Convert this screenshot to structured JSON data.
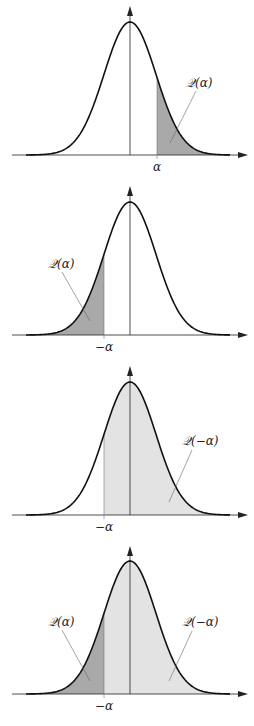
{
  "colors": {
    "curve": "#111111",
    "axis": "#222222",
    "dark_shade": "#a9a9a9",
    "light_shade": "#e3e3e3",
    "leader": "#666666"
  },
  "gaussian": {
    "center_x": 130,
    "sigma_px": 26,
    "height_px": 133,
    "x_min": 12,
    "x_max": 248
  },
  "panels": [
    {
      "id": "panel-1",
      "axis_y": 155,
      "top_y": 6,
      "marker_x": 157,
      "marker_label": "α",
      "regions": [
        {
          "from": 157,
          "to": 248,
          "shade": "dark"
        }
      ],
      "annotations": [
        {
          "text": "𝒬(α)",
          "tx": 186,
          "ty": 87,
          "lx1": 196,
          "ly1": 91,
          "lx2": 170,
          "ly2": 143
        }
      ]
    },
    {
      "id": "panel-2",
      "axis_y": 335,
      "top_y": 186,
      "marker_x": 104,
      "marker_label": "−α",
      "regions": [
        {
          "from": 12,
          "to": 104,
          "shade": "dark"
        }
      ],
      "annotations": [
        {
          "text": "𝒬(α)",
          "tx": 48,
          "ty": 268,
          "lx1": 62,
          "ly1": 272,
          "lx2": 90,
          "ly2": 321
        }
      ]
    },
    {
      "id": "panel-3",
      "axis_y": 515,
      "top_y": 366,
      "marker_x": 104,
      "marker_label": "−α",
      "regions": [
        {
          "from": 104,
          "to": 248,
          "shade": "light"
        }
      ],
      "annotations": [
        {
          "text": "𝒬(−α)",
          "tx": 182,
          "ty": 445,
          "lx1": 192,
          "ly1": 450,
          "lx2": 169,
          "ly2": 502
        }
      ]
    },
    {
      "id": "panel-4",
      "axis_y": 694,
      "top_y": 546,
      "marker_x": 104,
      "marker_label": "−α",
      "regions": [
        {
          "from": 104,
          "to": 248,
          "shade": "light"
        },
        {
          "from": 12,
          "to": 104,
          "shade": "dark"
        }
      ],
      "annotations": [
        {
          "text": "𝒬(α)",
          "tx": 48,
          "ty": 626,
          "lx1": 62,
          "ly1": 630,
          "lx2": 90,
          "ly2": 681
        },
        {
          "text": "𝒬(−α)",
          "tx": 182,
          "ty": 626,
          "lx1": 192,
          "ly1": 631,
          "lx2": 169,
          "ly2": 681
        }
      ]
    }
  ]
}
